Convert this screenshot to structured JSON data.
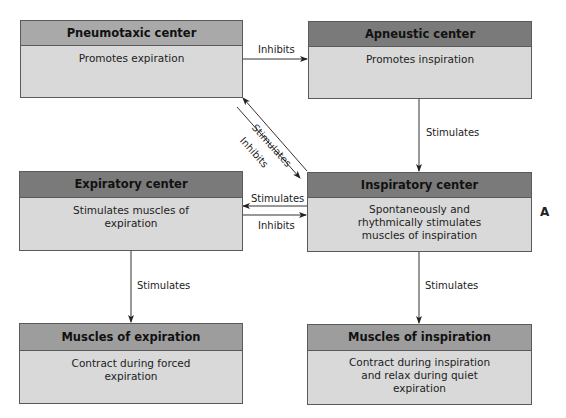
{
  "nodes": {
    "pneumotaxic": {
      "title": "Pneumotaxic center",
      "description": "Promotes expiration"
    },
    "apneustic": {
      "title": "Apneustic center",
      "description": "Promotes inspiration"
    },
    "expiratory": {
      "title": "Expiratory center",
      "description_lines": [
        "Stimulates muscles of",
        "expiration"
      ]
    },
    "inspiratory": {
      "title": "Inspiratory center",
      "description_lines": [
        "Spontaneously and",
        "rhythmically stimulates",
        "muscles of inspiration"
      ]
    },
    "muscles_expiration": {
      "title": "Muscles of expiration",
      "description_lines": [
        "Contract during forced",
        "expiration"
      ]
    },
    "muscles_inspiration": {
      "title": "Muscles of inspiration",
      "description_lines": [
        "Contract during inspiration",
        "and relax during quiet",
        "expiration"
      ]
    }
  },
  "edges": [
    {
      "from": "Pneumotaxic center",
      "to": "Apneustic center",
      "label": "Inhibits"
    },
    {
      "from": "Apneustic center",
      "to": "Inspiratory center",
      "label": "Stimulates"
    },
    {
      "from": "Inspiratory center",
      "to": "Pneumotaxic center",
      "label": "Stimulates"
    },
    {
      "from": "Pneumotaxic center",
      "to": "Inspiratory center",
      "label": "Inhibits"
    },
    {
      "from": "Inspiratory center",
      "to": "Expiratory center",
      "label": "Stimulates"
    },
    {
      "from": "Expiratory center",
      "to": "Inspiratory center",
      "label": "Inhibits"
    },
    {
      "from": "Expiratory center",
      "to": "Muscles of expiration",
      "label": "Stimulates"
    },
    {
      "from": "Inspiratory center",
      "to": "Muscles of inspiration",
      "label": "Stimulates"
    }
  ],
  "edge_labels": {
    "pneumo_to_apneustic": "Inhibits",
    "apneustic_to_inspiratory": "Stimulates",
    "diag_stimulates": "Stimulates",
    "diag_inhibits": "Inhibits",
    "insp_to_exp": "Stimulates",
    "exp_to_insp": "Inhibits",
    "exp_to_muscles": "Stimulates",
    "insp_to_muscles": "Stimulates"
  },
  "panel_label": "A",
  "colors": {
    "header_light": "#a9a9a9",
    "header_dark": "#7a7a7a",
    "box_body": "#d9d9d9",
    "line": "#3a3a3a"
  }
}
